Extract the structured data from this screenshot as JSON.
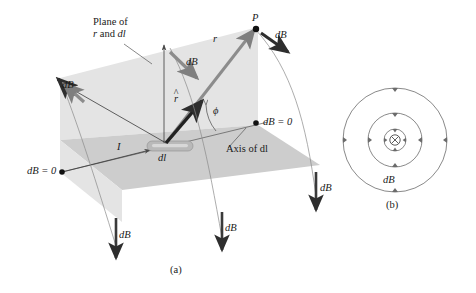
{
  "figure": {
    "type": "physics-diagram",
    "topic": "Biot-Savart law: magnetic field dB of a current element dl",
    "panels": [
      {
        "id": "a",
        "caption": "(a)"
      },
      {
        "id": "b",
        "caption": "(b)"
      }
    ]
  },
  "panel_a": {
    "caption": "(a)",
    "labels": {
      "plane_line1": "Plane of",
      "plane_line2_pre": "r",
      "plane_line2_mid": " and ",
      "plane_line2_post": "dl",
      "point_p": "P",
      "vector_r": "r",
      "unit_vector_r": "r",
      "unit_vector_hat": "^",
      "angle_phi": "ϕ",
      "current_I": "I",
      "element_dl": "dl",
      "axis_of_dl": "Axis of dl",
      "db_zero_right": "dB = 0",
      "db_zero_left": "dB = 0",
      "db": "dB"
    },
    "db_vectors": [
      {
        "name": "db-top-left",
        "label": "dB",
        "label_x": 56,
        "label_y": 85,
        "direction": "up-left"
      },
      {
        "name": "db-upper-middle",
        "label": "dB",
        "label_x": 186,
        "label_y": 62,
        "direction": "down-right"
      },
      {
        "name": "db-at-p",
        "label": "dB",
        "label_x": 276,
        "label_y": 36,
        "direction": "down-right"
      },
      {
        "name": "db-bottom-left",
        "label": "dB",
        "label_x": 119,
        "label_y": 236,
        "direction": "down"
      },
      {
        "name": "db-bottom-mid",
        "label": "dB",
        "label_x": 225,
        "label_y": 228,
        "direction": "down"
      },
      {
        "name": "db-bottom-right",
        "label": "dB",
        "label_x": 320,
        "label_y": 188,
        "direction": "down"
      }
    ],
    "zero_points": [
      {
        "name": "db-zero-right",
        "label": "dB = 0",
        "x": 262,
        "y": 122
      },
      {
        "name": "db-zero-left",
        "label": "dB = 0",
        "x": 27,
        "y": 170
      }
    ],
    "colors": {
      "vertical_plane": "#e3e3e3",
      "horizontal_plane": "#cccccc",
      "dl_element": "#b4b4b4",
      "arrow_gray": "#8c8c8c",
      "arrow_dark": "#3a3a3a",
      "line": "#555555",
      "text": "#1a1a1a"
    }
  },
  "panel_b": {
    "caption": "(b)",
    "labels": {
      "db": "dB",
      "current_into_page": "⊗"
    },
    "circles": [
      {
        "name": "field-circle-inner",
        "radius": 10
      },
      {
        "name": "field-circle-middle",
        "radius": 27
      },
      {
        "name": "field-circle-outer",
        "radius": 52
      }
    ],
    "center": {
      "x": 395,
      "y": 140
    },
    "db_label": {
      "x": 384,
      "y": 180
    },
    "colors": {
      "stroke": "#6b6b6b",
      "text": "#1a1a1a"
    }
  }
}
